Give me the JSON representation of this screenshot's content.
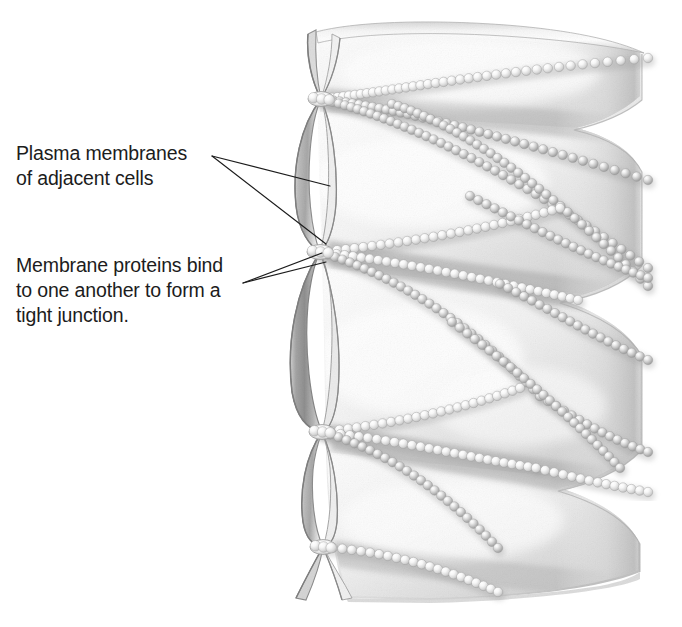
{
  "figure": {
    "name": "tight-junction-illustration",
    "type": "biological-diagram",
    "background_color": "#ffffff",
    "ink_color": "#1c1c1c"
  },
  "labels": [
    {
      "id": "plasma-membranes",
      "lines": [
        "Plasma membranes",
        "of adjacent cells"
      ],
      "x": 16,
      "y": 160,
      "line_height": 25,
      "leader_origin": {
        "x": 212,
        "y": 156
      },
      "leader_targets": [
        {
          "x": 330,
          "y": 186
        },
        {
          "x": 326,
          "y": 244
        }
      ]
    },
    {
      "id": "membrane-proteins",
      "lines": [
        "Membrane proteins bind",
        "to one another to form a",
        "tight junction."
      ],
      "x": 16,
      "y": 272,
      "line_height": 25,
      "leader_origin": {
        "x": 243,
        "y": 283
      },
      "leader_targets": [
        {
          "x": 322,
          "y": 253
        },
        {
          "x": 326,
          "y": 262
        }
      ]
    }
  ],
  "palette": {
    "membrane_light": "#fbfbfb",
    "membrane_mid": "#dcdcdc",
    "membrane_shadow": "#a9a9a9",
    "membrane_deep_shadow": "#8d8d8d",
    "outline": "#9a9a9a",
    "bead_light": "#f2f2f2",
    "bead_mid": "#c6c6c6",
    "bead_dark": "#9e9e9e",
    "junction_highlight": "#fdfdfd"
  },
  "structure": {
    "sheet_bounds": {
      "left": 300,
      "top": 18,
      "right": 646,
      "bottom": 602
    },
    "junction_points": [
      {
        "id": "junction-1",
        "x": 321,
        "y": 99
      },
      {
        "id": "junction-2",
        "x": 320,
        "y": 252
      },
      {
        "id": "junction-3",
        "x": 322,
        "y": 432
      },
      {
        "id": "junction-4",
        "x": 323,
        "y": 547
      }
    ],
    "fold_count": 4,
    "strand_count": 9,
    "bead_diameter": 9.5,
    "bead_spacing": 8.6,
    "description": "Two adjacent plasma membranes fuse at periodic pinch points along the left edge; rows of membrane proteins (beads) radiate rightward across the membrane face forming an anastomosing network of sealing strands."
  }
}
